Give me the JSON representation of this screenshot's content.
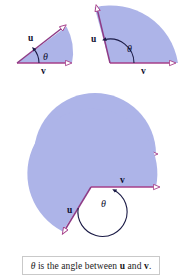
{
  "figure": {
    "caption": {
      "theta_symbol": "θ",
      "text_part_1": " is the angle between ",
      "vector_u": "u",
      "text_part_2": " and ",
      "vector_v": "v",
      "text_part_3": "."
    },
    "colors": {
      "sector_fill": "#adb4e8",
      "sector_fill_alt": "#b3b9ea",
      "vector_stroke": "#a63f8a",
      "vector_stroke_dark": "#8e3b86",
      "arc_stroke": "#1b1b46",
      "label_color": "#101030",
      "arrowhead_fill": "#ffffff",
      "center_dot": "#000000",
      "caption_border": "#c9c9c9",
      "background": "#ffffff"
    },
    "panels": [
      {
        "id": "acute-angle",
        "name": "acute angle panel",
        "position": "top-left",
        "angle_description": "acute",
        "angle_degrees": 28,
        "labels": {
          "u": "u",
          "v": "v",
          "theta": "θ"
        }
      },
      {
        "id": "obtuse-angle",
        "name": "obtuse angle panel",
        "position": "top-right",
        "angle_description": "obtuse",
        "angle_degrees": 110,
        "labels": {
          "u": "u",
          "v": "v",
          "theta": "θ"
        }
      },
      {
        "id": "straight-angle",
        "name": "straight angle panel",
        "position": "middle",
        "angle_description": "straight",
        "angle_degrees": 180,
        "labels": {
          "u": "u",
          "v": "v",
          "theta": "θ"
        }
      },
      {
        "id": "reflex-angle",
        "name": "reflex angle panel",
        "position": "bottom",
        "angle_description": "reflex",
        "angle_degrees": 245,
        "labels": {
          "u": "u",
          "v": "v",
          "theta": "θ"
        }
      }
    ]
  }
}
